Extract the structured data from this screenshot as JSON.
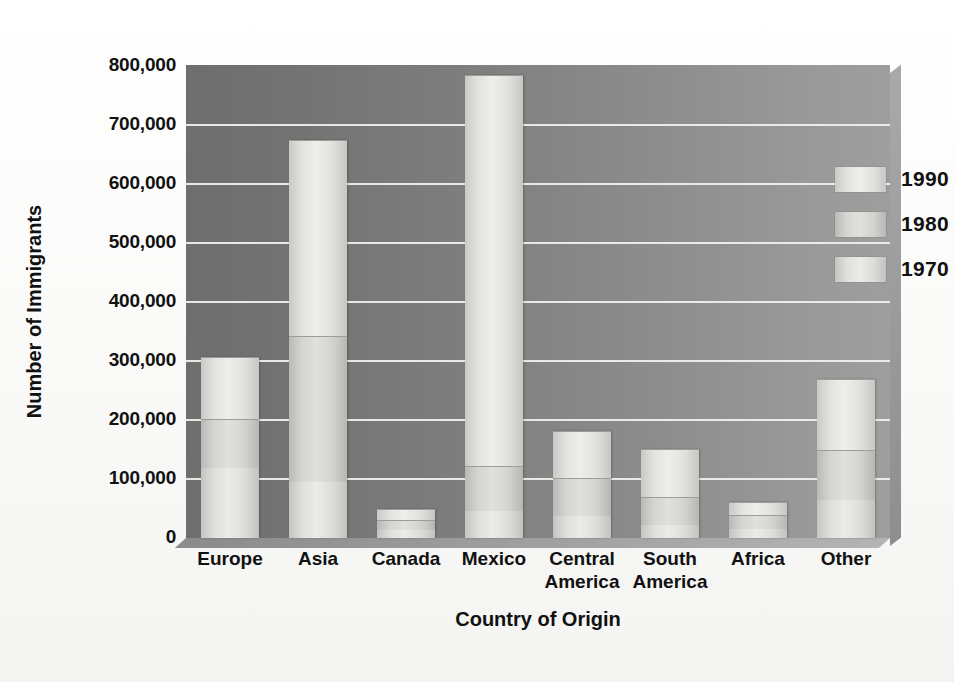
{
  "chart_data": {
    "type": "bar",
    "subtype": "stacked-column",
    "title": "",
    "xlabel": "Country of Origin",
    "ylabel": "Number of Immigrants",
    "categories": [
      "Europe",
      "Asia",
      "Canada",
      "Mexico",
      "Central America",
      "South America",
      "Africa",
      "Other"
    ],
    "category_labels": [
      "Europe",
      "Asia",
      "Canada",
      "Mexico",
      "Central\nAmerica",
      "South\nAmerica",
      "Africa",
      "Other"
    ],
    "series": [
      {
        "name": "1970",
        "values": [
          103000,
          330000,
          17000,
          660000,
          78000,
          80000,
          20000,
          117000
        ]
      },
      {
        "name": "1980",
        "values": [
          82000,
          245000,
          14000,
          75000,
          62000,
          46000,
          21000,
          83000
        ]
      },
      {
        "name": "1990",
        "values": [
          118000,
          95000,
          14000,
          45000,
          38000,
          22000,
          16000,
          65000
        ]
      }
    ],
    "stack_order_bottom_to_top": [
      "1990",
      "1980",
      "1970"
    ],
    "totals": [
      303000,
      670000,
      45000,
      780000,
      178000,
      148000,
      57000,
      265000
    ],
    "ylim": [
      0,
      800000
    ],
    "ytick_values": [
      0,
      100000,
      200000,
      300000,
      400000,
      500000,
      600000,
      700000,
      800000
    ],
    "ytick_labels": [
      "0",
      "100,000",
      "200,000",
      "300,000",
      "400,000",
      "500,000",
      "600,000",
      "700,000",
      "800,000"
    ],
    "grid": true,
    "grid_axis": "y",
    "legend_position": "top-right",
    "legend_entries": [
      "1990",
      "1980",
      "1970"
    ]
  },
  "colors": {
    "plot_background_left": "#6e6e6e",
    "plot_background_right": "#9e9e9e",
    "gridline": "#f2f2f0",
    "bar_1970": "#eeeeea",
    "bar_1980": "#e0e0dc",
    "bar_1990": "#ebebe7",
    "text": "#111111",
    "page_background": "#fdfdfc"
  }
}
